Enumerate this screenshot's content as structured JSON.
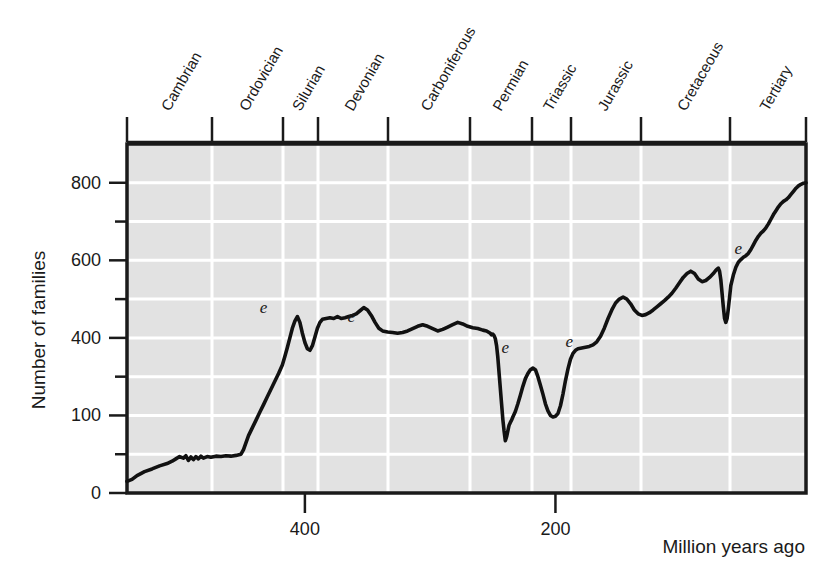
{
  "chart_data": {
    "type": "line",
    "title": "",
    "subtitle": "",
    "xlabel": "Million years ago",
    "ylabel": "Number of families",
    "xlim": [
      542,
      0
    ],
    "ylim": [
      0,
      900
    ],
    "x_axis_reversed": true,
    "grid": true,
    "legend_position": "none",
    "x_ticks": [
      {
        "value": 400,
        "label": "400"
      },
      {
        "value": 200,
        "label": "200"
      }
    ],
    "y_ticks": [
      {
        "value": 0,
        "label": "0"
      },
      {
        "value": 100,
        "label": ""
      },
      {
        "value": 200,
        "label": "100"
      },
      {
        "value": 300,
        "label": ""
      },
      {
        "value": 400,
        "label": "400"
      },
      {
        "value": 500,
        "label": ""
      },
      {
        "value": 600,
        "label": "600"
      },
      {
        "value": 700,
        "label": ""
      },
      {
        "value": 800,
        "label": "800"
      }
    ],
    "geologic_periods": [
      {
        "name": "Cambrian",
        "start": 542,
        "end": 488
      },
      {
        "name": "Ordovician",
        "start": 488,
        "end": 444
      },
      {
        "name": "Silurian",
        "start": 444,
        "end": 416
      },
      {
        "name": "Devonian",
        "start": 416,
        "end": 359
      },
      {
        "name": "Carboniferous",
        "start": 359,
        "end": 299
      },
      {
        "name": "Permian",
        "start": 299,
        "end": 251
      },
      {
        "name": "Triassic",
        "start": 251,
        "end": 200
      },
      {
        "name": "Jurassic",
        "start": 200,
        "end": 145
      },
      {
        "name": "Cretaceous",
        "start": 145,
        "end": 65
      },
      {
        "name": "Tertiary",
        "start": 65,
        "end": 0
      }
    ],
    "extinction_markers": [
      {
        "label": "e",
        "name": "end-Ordovician",
        "x": 444,
        "y": 450
      },
      {
        "label": "e",
        "name": "late-Devonian",
        "x": 374,
        "y": 425
      },
      {
        "label": "e",
        "name": "end-Permian",
        "x": 251,
        "y": 345
      },
      {
        "label": "e",
        "name": "end-Triassic",
        "x": 200,
        "y": 360
      },
      {
        "label": "e",
        "name": "end-Cretaceous",
        "x": 65,
        "y": 600
      }
    ],
    "series": [
      {
        "name": "Number of families",
        "points": [
          [
            542,
            30
          ],
          [
            538,
            35
          ],
          [
            534,
            45
          ],
          [
            528,
            55
          ],
          [
            522,
            62
          ],
          [
            516,
            70
          ],
          [
            510,
            76
          ],
          [
            506,
            82
          ],
          [
            503,
            88
          ],
          [
            500,
            94
          ],
          [
            497,
            90
          ],
          [
            495,
            96
          ],
          [
            493,
            84
          ],
          [
            491,
            93
          ],
          [
            489,
            86
          ],
          [
            487,
            94
          ],
          [
            485,
            88
          ],
          [
            483,
            95
          ],
          [
            481,
            90
          ],
          [
            478,
            94
          ],
          [
            475,
            92
          ],
          [
            471,
            95
          ],
          [
            467,
            94
          ],
          [
            463,
            96
          ],
          [
            459,
            95
          ],
          [
            455,
            97
          ],
          [
            451,
            100
          ],
          [
            449,
            112
          ],
          [
            447,
            130
          ],
          [
            445,
            148
          ],
          [
            442,
            168
          ],
          [
            439,
            188
          ],
          [
            436,
            208
          ],
          [
            433,
            228
          ],
          [
            430,
            248
          ],
          [
            427,
            268
          ],
          [
            424,
            288
          ],
          [
            421,
            308
          ],
          [
            418,
            330
          ],
          [
            416,
            352
          ],
          [
            414,
            375
          ],
          [
            412,
            400
          ],
          [
            410,
            425
          ],
          [
            408,
            443
          ],
          [
            406,
            455
          ],
          [
            404,
            440
          ],
          [
            402,
            412
          ],
          [
            400,
            388
          ],
          [
            398,
            372
          ],
          [
            396,
            368
          ],
          [
            394,
            380
          ],
          [
            392,
            402
          ],
          [
            390,
            425
          ],
          [
            388,
            440
          ],
          [
            386,
            448
          ],
          [
            383,
            450
          ],
          [
            380,
            452
          ],
          [
            377,
            450
          ],
          [
            374,
            455
          ],
          [
            371,
            450
          ],
          [
            368,
            452
          ],
          [
            365,
            455
          ],
          [
            362,
            458
          ],
          [
            359,
            462
          ],
          [
            356,
            470
          ],
          [
            353,
            478
          ],
          [
            350,
            472
          ],
          [
            347,
            458
          ],
          [
            344,
            440
          ],
          [
            341,
            425
          ],
          [
            338,
            418
          ],
          [
            334,
            415
          ],
          [
            330,
            414
          ],
          [
            326,
            412
          ],
          [
            322,
            414
          ],
          [
            318,
            418
          ],
          [
            314,
            424
          ],
          [
            310,
            430
          ],
          [
            306,
            434
          ],
          [
            302,
            430
          ],
          [
            298,
            424
          ],
          [
            294,
            418
          ],
          [
            290,
            422
          ],
          [
            286,
            428
          ],
          [
            282,
            434
          ],
          [
            278,
            440
          ],
          [
            274,
            436
          ],
          [
            270,
            430
          ],
          [
            266,
            426
          ],
          [
            262,
            424
          ],
          [
            258,
            420
          ],
          [
            255,
            418
          ],
          [
            253,
            414
          ],
          [
            252,
            412
          ],
          [
            251,
            408
          ],
          [
            250,
            410
          ],
          [
            249,
            406
          ],
          [
            248,
            398
          ],
          [
            247,
            380
          ],
          [
            246,
            350
          ],
          [
            245,
            310
          ],
          [
            244,
            270
          ],
          [
            243,
            230
          ],
          [
            242,
            190
          ],
          [
            241,
            160
          ],
          [
            240,
            135
          ],
          [
            239,
            145
          ],
          [
            238,
            160
          ],
          [
            237,
            175
          ],
          [
            236,
            182
          ],
          [
            235,
            188
          ],
          [
            234,
            196
          ],
          [
            232,
            210
          ],
          [
            230,
            230
          ],
          [
            228,
            252
          ],
          [
            226,
            275
          ],
          [
            224,
            295
          ],
          [
            222,
            308
          ],
          [
            220,
            318
          ],
          [
            218,
            322
          ],
          [
            216,
            318
          ],
          [
            214,
            300
          ],
          [
            212,
            278
          ],
          [
            210,
            255
          ],
          [
            208,
            230
          ],
          [
            206,
            212
          ],
          [
            204,
            200
          ],
          [
            202,
            196
          ],
          [
            200,
            198
          ],
          [
            198,
            205
          ],
          [
            196,
            225
          ],
          [
            194,
            255
          ],
          [
            192,
            290
          ],
          [
            190,
            320
          ],
          [
            188,
            345
          ],
          [
            186,
            360
          ],
          [
            184,
            368
          ],
          [
            182,
            372
          ],
          [
            179,
            374
          ],
          [
            176,
            376
          ],
          [
            173,
            378
          ],
          [
            170,
            382
          ],
          [
            167,
            390
          ],
          [
            164,
            404
          ],
          [
            161,
            425
          ],
          [
            158,
            450
          ],
          [
            155,
            472
          ],
          [
            152,
            490
          ],
          [
            149,
            500
          ],
          [
            146,
            505
          ],
          [
            143,
            500
          ],
          [
            140,
            488
          ],
          [
            137,
            472
          ],
          [
            134,
            462
          ],
          [
            131,
            458
          ],
          [
            128,
            460
          ],
          [
            125,
            465
          ],
          [
            122,
            472
          ],
          [
            119,
            480
          ],
          [
            116,
            488
          ],
          [
            113,
            496
          ],
          [
            110,
            505
          ],
          [
            107,
            515
          ],
          [
            104,
            528
          ],
          [
            101,
            542
          ],
          [
            98,
            556
          ],
          [
            95,
            566
          ],
          [
            92,
            572
          ],
          [
            89,
            566
          ],
          [
            86,
            552
          ],
          [
            83,
            545
          ],
          [
            80,
            548
          ],
          [
            77,
            556
          ],
          [
            74,
            566
          ],
          [
            72,
            574
          ],
          [
            70,
            580
          ],
          [
            69,
            572
          ],
          [
            68,
            550
          ],
          [
            67,
            515
          ],
          [
            66,
            480
          ],
          [
            65,
            450
          ],
          [
            64,
            440
          ],
          [
            63,
            450
          ],
          [
            62,
            475
          ],
          [
            61,
            505
          ],
          [
            60,
            535
          ],
          [
            58,
            562
          ],
          [
            56,
            582
          ],
          [
            54,
            595
          ],
          [
            52,
            602
          ],
          [
            50,
            608
          ],
          [
            48,
            612
          ],
          [
            46,
            618
          ],
          [
            44,
            628
          ],
          [
            42,
            640
          ],
          [
            40,
            652
          ],
          [
            38,
            662
          ],
          [
            36,
            670
          ],
          [
            34,
            676
          ],
          [
            32,
            684
          ],
          [
            30,
            694
          ],
          [
            28,
            706
          ],
          [
            26,
            718
          ],
          [
            24,
            728
          ],
          [
            22,
            738
          ],
          [
            20,
            746
          ],
          [
            18,
            752
          ],
          [
            16,
            756
          ],
          [
            14,
            762
          ],
          [
            12,
            770
          ],
          [
            10,
            778
          ],
          [
            8,
            786
          ],
          [
            6,
            792
          ],
          [
            4,
            796
          ],
          [
            2,
            799
          ],
          [
            0,
            800
          ]
        ]
      }
    ]
  },
  "plot_geometry": {
    "left": 127,
    "right": 806,
    "top": 144,
    "bottom": 493,
    "period_tick_x": [
      127,
      212,
      283,
      318,
      388,
      470,
      532,
      571,
      641,
      730,
      806
    ]
  },
  "colors": {
    "plot_background": "#e2e2e2",
    "gridline": "#ffffff",
    "axis": "#1a1a1a",
    "curve": "#111111",
    "text": "#1a1a1a",
    "page_background": "#ffffff"
  }
}
